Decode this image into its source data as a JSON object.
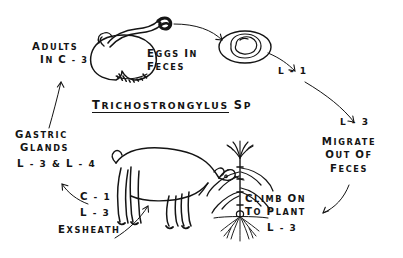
{
  "diagram": {
    "title_parts": {
      "underlined": "Trichostrongylus",
      "plain": "sp"
    },
    "background_color": "#ffffff",
    "ink_color": "#141414"
  },
  "labels": {
    "adults": {
      "line1": "Adults",
      "line2": "in C - 3"
    },
    "eggs": {
      "line1": "Eggs in",
      "line2": "Feces"
    },
    "l1": "L - 1",
    "l3_right": "L - 3",
    "migrate": {
      "line1": "Migrate",
      "line2": "out of",
      "line3": "Feces"
    },
    "climb": {
      "line1": "Climb on",
      "line2": "to plant",
      "line3": "L - 3"
    },
    "exsheath": {
      "line1": "C - 1",
      "line2": "L - 3",
      "line3": "Exsheath"
    },
    "gastric": {
      "line1": "Gastric",
      "line2": "Glands",
      "line3": "L - 3 & L - 4"
    }
  },
  "figures": {
    "abomasum": "abomasum-with-adult-worms",
    "egg": "egg-with-larva",
    "ruminant": "grazing-ruminant",
    "plant": "grass-plant-with-roots"
  },
  "arrows": [
    {
      "name": "worm-to-egg",
      "from": "abomasum",
      "to": "egg"
    },
    {
      "name": "egg-to-l1",
      "from": "egg",
      "to": "L - 1"
    },
    {
      "name": "l1-to-l3",
      "from": "L - 1",
      "to": "L - 3"
    },
    {
      "name": "feces-to-plant",
      "from": "Migrate out of Feces",
      "to": "Climb on to plant"
    },
    {
      "name": "exsheath-to-host",
      "from": "Exsheath",
      "to": "ruminant"
    },
    {
      "name": "c1-to-gastric-glands",
      "from": "C - 1 / L - 3",
      "to": "L - 3 & L - 4"
    },
    {
      "name": "gastric-glands-to-adults",
      "from": "Gastric Glands",
      "to": "in C - 3"
    }
  ]
}
